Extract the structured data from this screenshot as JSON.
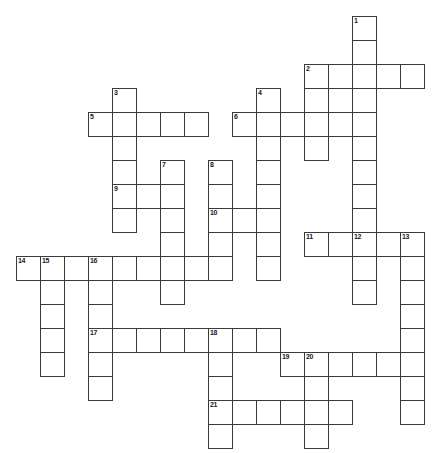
{
  "puzzle": {
    "type": "crossword-grid",
    "title": "",
    "background_color": "#ffffff",
    "cell_border_color": "#3a3a3a",
    "number_color": "#1a1a1a",
    "cell_size_px": 24,
    "origin_x_px": 16,
    "origin_y_px": 16,
    "columns": 18,
    "rows": 18,
    "clue_numbers": [
      1,
      2,
      3,
      4,
      5,
      6,
      7,
      8,
      9,
      10,
      11,
      12,
      13,
      14,
      15,
      16,
      17,
      18,
      19,
      20,
      21
    ],
    "entries": [
      {
        "number": 1,
        "direction": "down",
        "row": 0,
        "col": 14,
        "length": 9
      },
      {
        "number": 2,
        "direction": "across",
        "row": 2,
        "col": 12,
        "length": 5
      },
      {
        "number": 2,
        "direction": "down",
        "row": 2,
        "col": 12,
        "length": 3
      },
      {
        "number": 3,
        "direction": "down",
        "row": 3,
        "col": 4,
        "length": 7
      },
      {
        "number": 4,
        "direction": "down",
        "row": 3,
        "col": 10,
        "length": 8
      },
      {
        "number": 5,
        "direction": "across",
        "row": 4,
        "col": 3,
        "length": 5
      },
      {
        "number": 6,
        "direction": "across",
        "row": 4,
        "col": 9,
        "length": 5
      },
      {
        "number": 7,
        "direction": "down",
        "row": 6,
        "col": 6,
        "length": 7
      },
      {
        "number": 8,
        "direction": "down",
        "row": 6,
        "col": 8,
        "length": 5
      },
      {
        "number": 9,
        "direction": "across",
        "row": 7,
        "col": 4,
        "length": 2
      },
      {
        "number": 10,
        "direction": "across",
        "row": 8,
        "col": 8,
        "length": 3
      },
      {
        "number": 11,
        "direction": "across",
        "row": 9,
        "col": 12,
        "length": 5
      },
      {
        "number": 12,
        "direction": "down",
        "row": 9,
        "col": 14,
        "length": 3
      },
      {
        "number": 13,
        "direction": "down",
        "row": 9,
        "col": 16,
        "length": 8
      },
      {
        "number": 14,
        "direction": "across",
        "row": 10,
        "col": 0,
        "length": 9
      },
      {
        "number": 15,
        "direction": "down",
        "row": 10,
        "col": 1,
        "length": 5
      },
      {
        "number": 16,
        "direction": "down",
        "row": 10,
        "col": 3,
        "length": 7
      },
      {
        "number": 17,
        "direction": "across",
        "row": 13,
        "col": 3,
        "length": 8
      },
      {
        "number": 18,
        "direction": "down",
        "row": 13,
        "col": 8,
        "length": 5
      },
      {
        "number": 19,
        "direction": "across",
        "row": 14,
        "col": 11,
        "length": 6
      },
      {
        "number": 20,
        "direction": "down",
        "row": 14,
        "col": 12,
        "length": 4
      },
      {
        "number": 21,
        "direction": "across",
        "row": 16,
        "col": 8,
        "length": 6
      }
    ],
    "cells": [
      {
        "row": 0,
        "col": 14,
        "number": "1"
      },
      {
        "row": 1,
        "col": 14,
        "number": ""
      },
      {
        "row": 2,
        "col": 12,
        "number": "2"
      },
      {
        "row": 2,
        "col": 13,
        "number": ""
      },
      {
        "row": 2,
        "col": 14,
        "number": ""
      },
      {
        "row": 2,
        "col": 15,
        "number": ""
      },
      {
        "row": 2,
        "col": 16,
        "number": ""
      },
      {
        "row": 3,
        "col": 4,
        "number": "3"
      },
      {
        "row": 3,
        "col": 10,
        "number": "4"
      },
      {
        "row": 3,
        "col": 12,
        "number": ""
      },
      {
        "row": 3,
        "col": 14,
        "number": ""
      },
      {
        "row": 4,
        "col": 3,
        "number": "5"
      },
      {
        "row": 4,
        "col": 4,
        "number": ""
      },
      {
        "row": 4,
        "col": 5,
        "number": ""
      },
      {
        "row": 4,
        "col": 6,
        "number": ""
      },
      {
        "row": 4,
        "col": 7,
        "number": ""
      },
      {
        "row": 4,
        "col": 9,
        "number": "6"
      },
      {
        "row": 4,
        "col": 10,
        "number": ""
      },
      {
        "row": 4,
        "col": 11,
        "number": ""
      },
      {
        "row": 4,
        "col": 12,
        "number": ""
      },
      {
        "row": 4,
        "col": 13,
        "number": ""
      },
      {
        "row": 4,
        "col": 14,
        "number": ""
      },
      {
        "row": 5,
        "col": 4,
        "number": ""
      },
      {
        "row": 5,
        "col": 10,
        "number": ""
      },
      {
        "row": 5,
        "col": 12,
        "number": ""
      },
      {
        "row": 5,
        "col": 14,
        "number": ""
      },
      {
        "row": 6,
        "col": 4,
        "number": ""
      },
      {
        "row": 6,
        "col": 6,
        "number": "7"
      },
      {
        "row": 6,
        "col": 8,
        "number": "8"
      },
      {
        "row": 6,
        "col": 10,
        "number": ""
      },
      {
        "row": 6,
        "col": 14,
        "number": ""
      },
      {
        "row": 7,
        "col": 4,
        "number": "9"
      },
      {
        "row": 7,
        "col": 5,
        "number": ""
      },
      {
        "row": 7,
        "col": 6,
        "number": ""
      },
      {
        "row": 7,
        "col": 8,
        "number": ""
      },
      {
        "row": 7,
        "col": 10,
        "number": ""
      },
      {
        "row": 7,
        "col": 14,
        "number": ""
      },
      {
        "row": 8,
        "col": 4,
        "number": ""
      },
      {
        "row": 8,
        "col": 6,
        "number": ""
      },
      {
        "row": 8,
        "col": 8,
        "number": "10"
      },
      {
        "row": 8,
        "col": 9,
        "number": ""
      },
      {
        "row": 8,
        "col": 10,
        "number": ""
      },
      {
        "row": 8,
        "col": 14,
        "number": ""
      },
      {
        "row": 9,
        "col": 6,
        "number": ""
      },
      {
        "row": 9,
        "col": 8,
        "number": ""
      },
      {
        "row": 9,
        "col": 10,
        "number": ""
      },
      {
        "row": 9,
        "col": 12,
        "number": "11"
      },
      {
        "row": 9,
        "col": 13,
        "number": ""
      },
      {
        "row": 9,
        "col": 14,
        "number": "12"
      },
      {
        "row": 9,
        "col": 15,
        "number": ""
      },
      {
        "row": 9,
        "col": 16,
        "number": "13"
      },
      {
        "row": 10,
        "col": 0,
        "number": "14"
      },
      {
        "row": 10,
        "col": 1,
        "number": "15"
      },
      {
        "row": 10,
        "col": 2,
        "number": ""
      },
      {
        "row": 10,
        "col": 3,
        "number": "16"
      },
      {
        "row": 10,
        "col": 4,
        "number": ""
      },
      {
        "row": 10,
        "col": 5,
        "number": ""
      },
      {
        "row": 10,
        "col": 6,
        "number": ""
      },
      {
        "row": 10,
        "col": 7,
        "number": ""
      },
      {
        "row": 10,
        "col": 8,
        "number": ""
      },
      {
        "row": 10,
        "col": 10,
        "number": ""
      },
      {
        "row": 10,
        "col": 14,
        "number": ""
      },
      {
        "row": 10,
        "col": 16,
        "number": ""
      },
      {
        "row": 11,
        "col": 1,
        "number": ""
      },
      {
        "row": 11,
        "col": 3,
        "number": ""
      },
      {
        "row": 11,
        "col": 6,
        "number": ""
      },
      {
        "row": 11,
        "col": 14,
        "number": ""
      },
      {
        "row": 11,
        "col": 16,
        "number": ""
      },
      {
        "row": 12,
        "col": 1,
        "number": ""
      },
      {
        "row": 12,
        "col": 3,
        "number": ""
      },
      {
        "row": 12,
        "col": 16,
        "number": ""
      },
      {
        "row": 13,
        "col": 1,
        "number": ""
      },
      {
        "row": 13,
        "col": 3,
        "number": "17"
      },
      {
        "row": 13,
        "col": 4,
        "number": ""
      },
      {
        "row": 13,
        "col": 5,
        "number": ""
      },
      {
        "row": 13,
        "col": 6,
        "number": ""
      },
      {
        "row": 13,
        "col": 7,
        "number": ""
      },
      {
        "row": 13,
        "col": 8,
        "number": "18"
      },
      {
        "row": 13,
        "col": 9,
        "number": ""
      },
      {
        "row": 13,
        "col": 10,
        "number": ""
      },
      {
        "row": 13,
        "col": 16,
        "number": ""
      },
      {
        "row": 14,
        "col": 1,
        "number": ""
      },
      {
        "row": 14,
        "col": 3,
        "number": ""
      },
      {
        "row": 14,
        "col": 8,
        "number": ""
      },
      {
        "row": 14,
        "col": 11,
        "number": "19"
      },
      {
        "row": 14,
        "col": 12,
        "number": "20"
      },
      {
        "row": 14,
        "col": 13,
        "number": ""
      },
      {
        "row": 14,
        "col": 14,
        "number": ""
      },
      {
        "row": 14,
        "col": 15,
        "number": ""
      },
      {
        "row": 14,
        "col": 16,
        "number": ""
      },
      {
        "row": 15,
        "col": 3,
        "number": ""
      },
      {
        "row": 15,
        "col": 8,
        "number": ""
      },
      {
        "row": 15,
        "col": 12,
        "number": ""
      },
      {
        "row": 15,
        "col": 16,
        "number": ""
      },
      {
        "row": 16,
        "col": 8,
        "number": "21"
      },
      {
        "row": 16,
        "col": 9,
        "number": ""
      },
      {
        "row": 16,
        "col": 10,
        "number": ""
      },
      {
        "row": 16,
        "col": 11,
        "number": ""
      },
      {
        "row": 16,
        "col": 12,
        "number": ""
      },
      {
        "row": 16,
        "col": 13,
        "number": ""
      },
      {
        "row": 16,
        "col": 16,
        "number": ""
      },
      {
        "row": 17,
        "col": 8,
        "number": ""
      },
      {
        "row": 17,
        "col": 12,
        "number": ""
      }
    ]
  }
}
